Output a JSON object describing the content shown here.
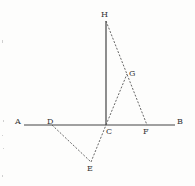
{
  "diagram": {
    "points": {
      "A": {
        "label": "A",
        "x": 24,
        "y": 125,
        "lx": 15,
        "ly": 124
      },
      "B": {
        "label": "B",
        "x": 175,
        "y": 125,
        "lx": 177,
        "ly": 124
      },
      "C": {
        "label": "C",
        "x": 106,
        "y": 125,
        "lx": 106,
        "ly": 134
      },
      "D": {
        "label": "D",
        "x": 52,
        "y": 125,
        "lx": 47,
        "ly": 124
      },
      "E": {
        "label": "E",
        "x": 91,
        "y": 162,
        "lx": 87,
        "ly": 171
      },
      "F": {
        "label": "F",
        "x": 147,
        "y": 125,
        "lx": 143,
        "ly": 134
      },
      "G": {
        "label": "G",
        "x": 127,
        "y": 74,
        "lx": 129,
        "ly": 76
      },
      "H": {
        "label": "H",
        "x": 106,
        "y": 21,
        "lx": 101,
        "ly": 17
      }
    },
    "solid_lines": [
      [
        "A",
        "B"
      ],
      [
        "C",
        "H"
      ]
    ],
    "dashed_lines": [
      [
        "H",
        "F"
      ],
      [
        "C",
        "G"
      ],
      [
        "D",
        "E"
      ],
      [
        "E",
        "C"
      ]
    ]
  }
}
